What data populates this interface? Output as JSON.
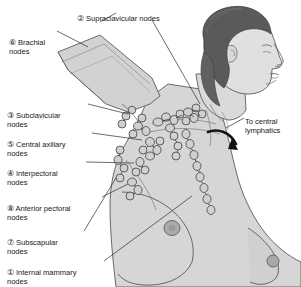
{
  "figure": {
    "colors": {
      "background": "#ffffff",
      "body_fill": "#d6d6d6",
      "body_shade": "#c4c4c4",
      "body_outline": "#4a4a4a",
      "hair": "#5a5a5a",
      "hair_highlight": "#6e6e6e",
      "node_outline": "#3a3a3a",
      "node_fill": "#d0d0d0",
      "arrow": "#111111",
      "leader_line": "#3a3a3a",
      "text": "#1a1a1a",
      "nipple": "#a8a8a8"
    }
  },
  "labels": {
    "supraclavicular": {
      "number": "②",
      "text": "Supraclavicular nodes"
    },
    "brachial": {
      "number": "⑥",
      "text": "Brachial\nnodes"
    },
    "subclavicular": {
      "number": "③",
      "text": "Subclavicular\nnodes"
    },
    "central_axillary": {
      "number": "⑤",
      "text": "Central axillary\nnodes"
    },
    "interpectoral": {
      "number": "④",
      "text": "Interpectoral\nnodes"
    },
    "anterior_pectoral": {
      "number": "⑧",
      "text": "Anterior pectoral\nnodes"
    },
    "subscapular": {
      "number": "⑦",
      "text": "Subscapular\nnodes"
    },
    "internal_mammary": {
      "number": "①",
      "text": "Internal mammary\nnodes"
    },
    "to_central_lymphatics": {
      "number": "",
      "text": "To central\nlymphatics"
    }
  }
}
